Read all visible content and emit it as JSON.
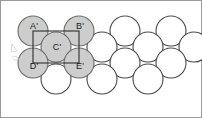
{
  "figure": {
    "canvas": {
      "width": 202,
      "height": 118,
      "background": "#ffffff"
    },
    "colors": {
      "shaded_fill": "#cdcdcd",
      "shaded_stroke": "#6b6b6b",
      "open_fill": "#ffffff",
      "open_stroke": "#4a4a4a",
      "square_stroke": "#2e2e2e",
      "frame_stroke": "#9a9a9a",
      "label_color": "#1a1a1a"
    },
    "geometry": {
      "sphere_radius": 15,
      "row_pitch_y": 16,
      "column_pitch_x": 46,
      "row_offset_x": 23
    }
  },
  "frame": {
    "x": 0.5,
    "y": 0.5,
    "width": 201,
    "height": 117
  },
  "unit_square": {
    "name": "unit-square",
    "x": 33,
    "y": 31,
    "width": 46,
    "height": 32,
    "corner_labels": [
      "A'",
      "B'",
      "E'",
      "D'"
    ],
    "center_label": "C'"
  },
  "labels": [
    {
      "text": "A'",
      "x": 34,
      "y": 27
    },
    {
      "text": "B'",
      "x": 80,
      "y": 27
    },
    {
      "text": "C'",
      "x": 57,
      "y": 48
    },
    {
      "text": "D'",
      "x": 34,
      "y": 67
    },
    {
      "text": "E'",
      "x": 80,
      "y": 67
    }
  ],
  "spheres": [
    {
      "id": "A'",
      "cx": 33,
      "cy": 31,
      "r": 15,
      "shaded": true
    },
    {
      "id": "B'",
      "cx": 79,
      "cy": 31,
      "r": 15,
      "shaded": true
    },
    {
      "id": "t3",
      "cx": 125,
      "cy": 31,
      "r": 15,
      "shaded": false
    },
    {
      "id": "t4",
      "cx": 171,
      "cy": 31,
      "r": 15,
      "shaded": false
    },
    {
      "id": "C'",
      "cx": 56,
      "cy": 47,
      "r": 15,
      "shaded": true
    },
    {
      "id": "m2",
      "cx": 102,
      "cy": 47,
      "r": 15,
      "shaded": false
    },
    {
      "id": "m3",
      "cx": 148,
      "cy": 47,
      "r": 15,
      "shaded": false
    },
    {
      "id": "m4",
      "cx": 194,
      "cy": 47,
      "r": 15,
      "shaded": false
    },
    {
      "id": "D'",
      "cx": 33,
      "cy": 63,
      "r": 15,
      "shaded": true
    },
    {
      "id": "E'",
      "cx": 79,
      "cy": 63,
      "r": 15,
      "shaded": true
    },
    {
      "id": "b3",
      "cx": 125,
      "cy": 63,
      "r": 15,
      "shaded": false
    },
    {
      "id": "b4",
      "cx": 171,
      "cy": 63,
      "r": 15,
      "shaded": false
    },
    {
      "id": "f1",
      "cx": 56,
      "cy": 79,
      "r": 15,
      "shaded": false
    },
    {
      "id": "f2",
      "cx": 102,
      "cy": 79,
      "r": 15,
      "shaded": false
    },
    {
      "id": "f3",
      "cx": 148,
      "cy": 79,
      "r": 15,
      "shaded": false
    }
  ],
  "artifacts": [
    {
      "id": "mark-1",
      "d": "M 12 44 l 5 7 l -6 1 z"
    },
    {
      "id": "mark-2",
      "d": "M 12 57 q 5 -2 7 2 q -4 3 -6 0"
    }
  ]
}
